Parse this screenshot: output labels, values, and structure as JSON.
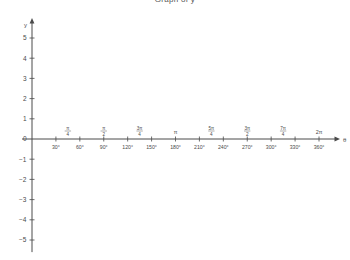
{
  "chart_data": {
    "type": "line",
    "title": "Graph of y",
    "xlabel": "θ",
    "ylabel": "y",
    "series": [],
    "grid": false,
    "legend": null,
    "ylim": [
      -5.5,
      5.5
    ],
    "xlim": [
      0,
      375
    ],
    "y_ticks": [
      "5",
      "4",
      "3",
      "2",
      "1",
      "0",
      "−1",
      "−2",
      "−3",
      "−4",
      "−5"
    ],
    "y_tick_values": [
      5,
      4,
      3,
      2,
      1,
      0,
      -1,
      -2,
      -3,
      -4,
      -5
    ],
    "x_ticks_degrees": [
      "30°",
      "60°",
      "90°",
      "120°",
      "150°",
      "180°",
      "210°",
      "240°",
      "270°",
      "300°",
      "330°",
      "360°"
    ],
    "x_tick_values": [
      30,
      60,
      90,
      120,
      150,
      180,
      210,
      240,
      270,
      300,
      330,
      360
    ],
    "x_ticks_radians": [
      {
        "degrees": 45,
        "numerator": "π",
        "denominator": "4",
        "plain": null
      },
      {
        "degrees": 90,
        "numerator": "π",
        "denominator": "2",
        "plain": null
      },
      {
        "degrees": 135,
        "numerator": "3π",
        "denominator": "4",
        "plain": null
      },
      {
        "degrees": 180,
        "numerator": null,
        "denominator": null,
        "plain": "π"
      },
      {
        "degrees": 225,
        "numerator": "5π",
        "denominator": "4",
        "plain": null
      },
      {
        "degrees": 270,
        "numerator": "3π",
        "denominator": "2",
        "plain": null
      },
      {
        "degrees": 315,
        "numerator": "7π",
        "denominator": "4",
        "plain": null
      },
      {
        "degrees": 360,
        "numerator": null,
        "denominator": null,
        "plain": "2π"
      }
    ],
    "origin_label": "0",
    "axis_color": "#4a4a4a",
    "background_color": "#ffffff"
  }
}
